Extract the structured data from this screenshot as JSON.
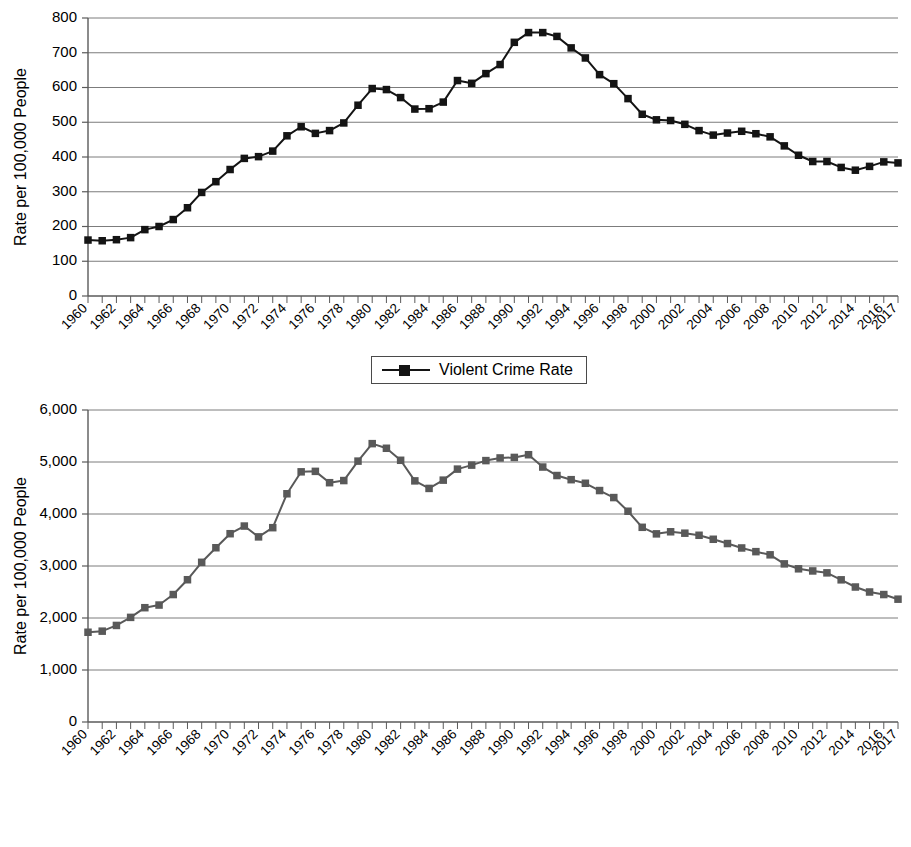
{
  "charts": [
    {
      "id": "violent-crime",
      "legend_label": "Violent Crime Rate",
      "ylabel": "Rate per 100,000 People",
      "marker_color": "#141414",
      "line_color": "#141414"
    },
    {
      "id": "property-crime",
      "legend_label": "Property Crime Rate",
      "ylabel": "Rate per 100,000 People",
      "marker_color": "#595959",
      "line_color": "#595959"
    }
  ],
  "chart_data": [
    {
      "type": "line",
      "title": "",
      "xlabel": "",
      "ylabel": "Rate per 100,000 People",
      "legend": [
        "Violent Crime Rate"
      ],
      "legend_position": "bottom-center",
      "grid": true,
      "ylim": [
        0,
        800
      ],
      "yticks": [
        0,
        100,
        200,
        300,
        400,
        500,
        600,
        700,
        800
      ],
      "ytick_labels": [
        "0",
        "100",
        "200",
        "300",
        "400",
        "500",
        "600",
        "700",
        "800"
      ],
      "x": [
        1960,
        1961,
        1962,
        1963,
        1964,
        1965,
        1966,
        1967,
        1968,
        1969,
        1970,
        1971,
        1972,
        1973,
        1974,
        1975,
        1976,
        1977,
        1978,
        1979,
        1980,
        1981,
        1982,
        1983,
        1984,
        1985,
        1986,
        1987,
        1988,
        1989,
        1990,
        1991,
        1992,
        1993,
        1994,
        1995,
        1996,
        1997,
        1998,
        1999,
        2000,
        2001,
        2002,
        2003,
        2004,
        2005,
        2006,
        2007,
        2008,
        2009,
        2010,
        2011,
        2012,
        2013,
        2014,
        2015,
        2016,
        2017
      ],
      "xtick_labels": [
        "1960",
        "1962",
        "1964",
        "1966",
        "1968",
        "1970",
        "1972",
        "1974",
        "1976",
        "1978",
        "1980",
        "1982",
        "1984",
        "1986",
        "1988",
        "1990",
        "1992",
        "1994",
        "1996",
        "1998",
        "2000",
        "2002",
        "2004",
        "2006",
        "2008",
        "2010",
        "2012",
        "2014",
        "2016",
        "2017"
      ],
      "series": [
        {
          "name": "Violent Crime Rate",
          "values": [
            161,
            159,
            162,
            168,
            191,
            200,
            220,
            254,
            298,
            329,
            364,
            396,
            401,
            417,
            461,
            487,
            468,
            476,
            498,
            549,
            597,
            594,
            571,
            538,
            539,
            558,
            620,
            612,
            640,
            666,
            730,
            758,
            758,
            747,
            714,
            685,
            637,
            611,
            568,
            523,
            507,
            505,
            494,
            476,
            463,
            469,
            474,
            467,
            458,
            432,
            405,
            387,
            387,
            370,
            362,
            373,
            386,
            383
          ]
        }
      ]
    },
    {
      "type": "line",
      "title": "",
      "xlabel": "",
      "ylabel": "Rate per 100,000 People",
      "legend": [
        "Property Crime Rate"
      ],
      "legend_position": "bottom-center",
      "grid": true,
      "ylim": [
        0,
        6000
      ],
      "yticks": [
        0,
        1000,
        2000,
        3000,
        4000,
        5000,
        6000
      ],
      "ytick_labels": [
        "0",
        "1,000",
        "2,000",
        "3,000",
        "4,000",
        "5,000",
        "6,000"
      ],
      "x": [
        1960,
        1961,
        1962,
        1963,
        1964,
        1965,
        1966,
        1967,
        1968,
        1969,
        1970,
        1971,
        1972,
        1973,
        1974,
        1975,
        1976,
        1977,
        1978,
        1979,
        1980,
        1981,
        1982,
        1983,
        1984,
        1985,
        1986,
        1987,
        1988,
        1989,
        1990,
        1991,
        1992,
        1993,
        1994,
        1995,
        1996,
        1997,
        1998,
        1999,
        2000,
        2001,
        2002,
        2003,
        2004,
        2005,
        2006,
        2007,
        2008,
        2009,
        2010,
        2011,
        2012,
        2013,
        2014,
        2015,
        2016,
        2017
      ],
      "xtick_labels": [
        "1960",
        "1962",
        "1964",
        "1966",
        "1968",
        "1970",
        "1972",
        "1974",
        "1976",
        "1978",
        "1980",
        "1982",
        "1984",
        "1986",
        "1988",
        "1990",
        "1992",
        "1994",
        "1996",
        "1998",
        "2000",
        "2002",
        "2004",
        "2006",
        "2008",
        "2010",
        "2012",
        "2014",
        "2016",
        "2017"
      ],
      "series": [
        {
          "name": "Property Crime Rate",
          "values": [
            1726,
            1747,
            1857,
            2012,
            2198,
            2249,
            2451,
            2736,
            3071,
            3351,
            3621,
            3768,
            3560,
            3737,
            4389,
            4811,
            4820,
            4602,
            4643,
            5017,
            5353,
            5264,
            5033,
            4637,
            4492,
            4651,
            4863,
            4940,
            5027,
            5078,
            5088,
            5140,
            4903,
            4740,
            4660,
            4591,
            4451,
            4316,
            4053,
            3744,
            3618,
            3658,
            3631,
            3591,
            3514,
            3432,
            3347,
            3276,
            3215,
            3041,
            2946,
            2905,
            2868,
            2734,
            2596,
            2500,
            2451,
            2362
          ]
        }
      ]
    }
  ]
}
